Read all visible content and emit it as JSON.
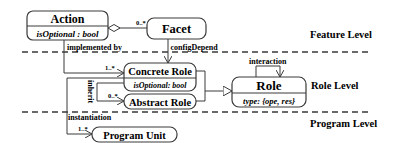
{
  "levels": {
    "feature": "Feature Level",
    "role": "Role Level",
    "program": "Program Level"
  },
  "classes": {
    "action": {
      "name": "Action",
      "attr": "isOptional : bool"
    },
    "facet": {
      "name": "Facet"
    },
    "concrete_role": {
      "name": "Concrete Role",
      "attr": "isOptional: bool"
    },
    "abstract_role": {
      "name": "Abstract Role"
    },
    "role": {
      "name": "Role",
      "attr": "type: {ope, res}"
    },
    "program_unit": {
      "name": "Program Unit"
    }
  },
  "relations": {
    "action_facet_mult": "0..*",
    "implemented_by": "implemented by",
    "implemented_by_mult": "1..*",
    "config_depend": "configDepend",
    "inherit": "inherit",
    "inherit_mult": "0..*",
    "interaction": "interaction",
    "instantiation": "instantiation",
    "instantiation_mult": "1..*"
  },
  "colors": {
    "stroke": "#3a3a3a",
    "text": "#2a2a2a",
    "background": "#ffffff"
  }
}
